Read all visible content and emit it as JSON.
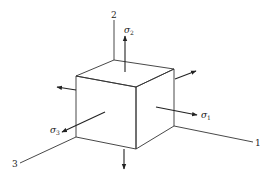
{
  "diagram": {
    "type": "stress-element-cube",
    "axes": [
      {
        "id": "axis-1",
        "label": "1"
      },
      {
        "id": "axis-2",
        "label": "2"
      },
      {
        "id": "axis-3",
        "label": "3"
      }
    ],
    "stresses": [
      {
        "id": "sigma-1",
        "symbol": "σ",
        "subscript": "1"
      },
      {
        "id": "sigma-2",
        "symbol": "σ",
        "subscript": "2"
      },
      {
        "id": "sigma-3",
        "symbol": "σ",
        "subscript": "3"
      }
    ],
    "colors": {
      "line": "#333333",
      "background": "#ffffff"
    }
  }
}
